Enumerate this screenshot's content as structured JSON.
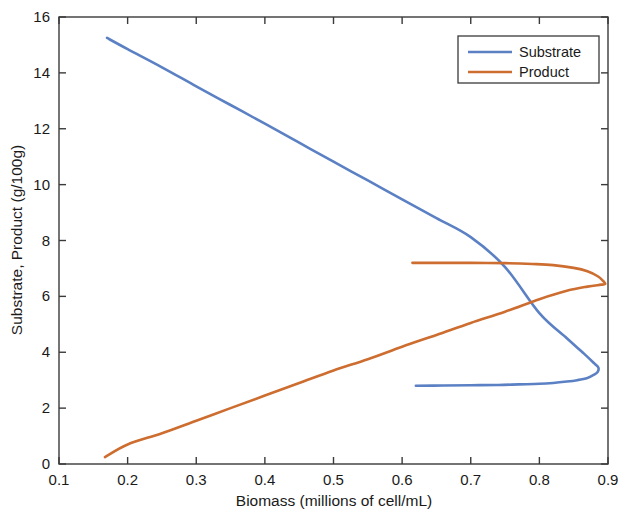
{
  "chart_data": {
    "type": "line",
    "title": "",
    "xlabel": "Biomass (millions of cell/mL)",
    "ylabel": "Substrate, Product (g/100g)",
    "xlim": [
      0.1,
      0.9
    ],
    "ylim": [
      0,
      16
    ],
    "xticks": [
      0.1,
      0.2,
      0.3,
      0.4,
      0.5,
      0.6,
      0.7,
      0.8,
      0.9
    ],
    "xtick_labels": [
      "0.1",
      "0.2",
      "0.3",
      "0.4",
      "0.5",
      "0.6",
      "0.7",
      "0.8",
      "0.9"
    ],
    "yticks": [
      0,
      2,
      4,
      6,
      8,
      10,
      12,
      14,
      16
    ],
    "ytick_labels": [
      "0",
      "2",
      "4",
      "6",
      "8",
      "10",
      "12",
      "14",
      "16"
    ],
    "grid": false,
    "legend_position": "upper right",
    "legend_entries": [
      "Substrate",
      "Product"
    ],
    "colors": {
      "substrate": "#5b81c4",
      "product": "#cd6d30",
      "axis": "#3a3a3a",
      "text": "#1a1a1a",
      "background": "#ffffff"
    },
    "series": [
      {
        "name": "Substrate",
        "color": "#5b81c4",
        "comment": "S-shaped branch: descends from upper-left, folds right near x=0.885, returns along flat lower branch at y~2.8",
        "x": [
          0.17,
          0.2,
          0.25,
          0.3,
          0.35,
          0.4,
          0.45,
          0.5,
          0.55,
          0.6,
          0.65,
          0.7,
          0.75,
          0.8,
          0.84,
          0.865,
          0.88,
          0.886,
          0.885,
          0.88,
          0.87,
          0.855,
          0.84,
          0.82,
          0.8,
          0.77,
          0.74,
          0.7,
          0.66,
          0.62
        ],
        "y": [
          15.25,
          14.85,
          14.2,
          13.52,
          12.85,
          12.18,
          11.5,
          10.82,
          10.15,
          9.47,
          8.8,
          8.12,
          7.05,
          5.4,
          4.5,
          3.95,
          3.6,
          3.45,
          3.3,
          3.2,
          3.08,
          3.0,
          2.95,
          2.9,
          2.87,
          2.85,
          2.83,
          2.82,
          2.81,
          2.8
        ]
      },
      {
        "name": "Product",
        "color": "#cd6d30",
        "comment": "Rises from lower-left, folds right near x=0.895 at y~6.4, returns left along upper branch at y~7.2",
        "x": [
          0.167,
          0.2,
          0.25,
          0.3,
          0.35,
          0.4,
          0.45,
          0.5,
          0.55,
          0.6,
          0.65,
          0.7,
          0.75,
          0.8,
          0.84,
          0.87,
          0.89,
          0.896,
          0.893,
          0.885,
          0.87,
          0.85,
          0.82,
          0.79,
          0.75,
          0.7,
          0.66,
          0.615
        ],
        "y": [
          0.25,
          0.7,
          1.1,
          1.55,
          2.0,
          2.45,
          2.9,
          3.35,
          3.75,
          4.2,
          4.62,
          5.05,
          5.45,
          5.9,
          6.2,
          6.35,
          6.42,
          6.45,
          6.55,
          6.72,
          6.9,
          7.02,
          7.12,
          7.16,
          7.19,
          7.2,
          7.2,
          7.2
        ]
      }
    ],
    "intersections": [
      {
        "x": 0.7,
        "y": 7.05
      },
      {
        "x": 0.8,
        "y": 5.4
      }
    ]
  }
}
